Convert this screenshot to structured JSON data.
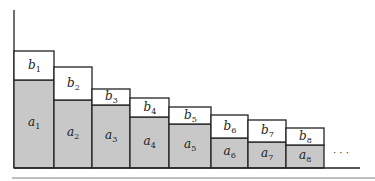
{
  "diagram": {
    "colors": {
      "shaded": "#c8c8c8",
      "white": "#ffffff",
      "stroke": "#222222",
      "rule": "#aaaaaa"
    },
    "bars": [
      {
        "a": "a",
        "a_sub": "1",
        "b": "b",
        "b_sub": "1",
        "x0": 14,
        "x1": 54,
        "top": 51,
        "split": 80
      },
      {
        "a": "a",
        "a_sub": "2",
        "b": "b",
        "b_sub": "2",
        "x0": 54,
        "x1": 92,
        "top": 67,
        "split": 100
      },
      {
        "a": "a",
        "a_sub": "3",
        "b": "b",
        "b_sub": "3",
        "x0": 92,
        "x1": 130,
        "top": 89,
        "split": 105
      },
      {
        "a": "a",
        "a_sub": "4",
        "b": "b",
        "b_sub": "4",
        "x0": 130,
        "x1": 169,
        "top": 98,
        "split": 117
      },
      {
        "a": "a",
        "a_sub": "5",
        "b": "b",
        "b_sub": "5",
        "x0": 169,
        "x1": 211,
        "top": 107,
        "split": 124
      },
      {
        "a": "a",
        "a_sub": "6",
        "b": "b",
        "b_sub": "6",
        "x0": 211,
        "x1": 248,
        "top": 115,
        "split": 138
      },
      {
        "a": "a",
        "a_sub": "7",
        "b": "b",
        "b_sub": "7",
        "x0": 248,
        "x1": 286,
        "top": 120,
        "split": 142
      },
      {
        "a": "a",
        "a_sub": "8",
        "b": "b",
        "b_sub": "8",
        "x0": 286,
        "x1": 324,
        "top": 128,
        "split": 145
      }
    ],
    "ellipsis": "· · ·",
    "baseline_y": 168,
    "axis_top": 10
  }
}
